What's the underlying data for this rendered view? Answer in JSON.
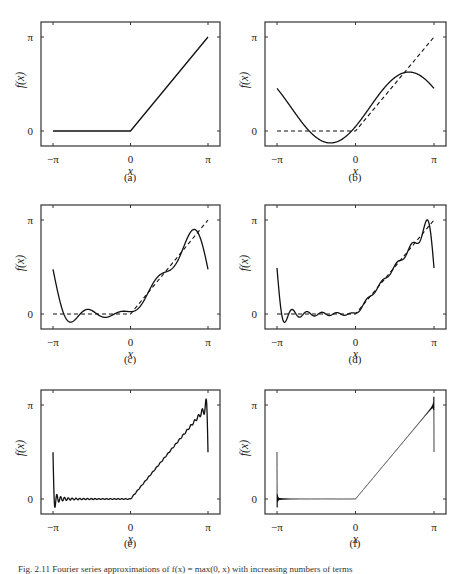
{
  "figure": {
    "caption": "Fig. 2.11  Fourier series approximations of f(x) = max(0, x) with increasing numbers of terms",
    "colors": {
      "curve": "#111111",
      "target": "#111111",
      "frame": "#333333",
      "text": "#222222"
    }
  },
  "axes_common": {
    "xlabel": "x",
    "ylabel": "f(x)",
    "xticks": [
      "−π",
      "0",
      "π"
    ],
    "yticks": [
      "0",
      "π"
    ]
  },
  "panels": [
    {
      "id": "a",
      "label": "(a)",
      "terms": 0,
      "show_target_dashed": false,
      "show_exact": true
    },
    {
      "id": "b",
      "label": "(b)",
      "terms": 1,
      "show_target_dashed": true,
      "show_exact": false
    },
    {
      "id": "c",
      "label": "(c)",
      "terms": 4,
      "show_target_dashed": true,
      "show_exact": false
    },
    {
      "id": "d",
      "label": "(d)",
      "terms": 10,
      "show_target_dashed": true,
      "show_exact": false
    },
    {
      "id": "e",
      "label": "(e)",
      "terms": 40,
      "show_target_dashed": false,
      "show_exact": false
    },
    {
      "id": "f",
      "label": "(f)",
      "terms": 400,
      "show_target_dashed": false,
      "show_exact": false
    }
  ],
  "chart_data": [
    {
      "type": "line",
      "title": "(a)",
      "xlabel": "x",
      "ylabel": "f(x)",
      "xlim": [
        -3.5,
        3.6
      ],
      "ylim": [
        -0.5,
        3.5
      ],
      "xticks": [
        "−π",
        "0",
        "π"
      ],
      "yticks": [
        "0",
        "π"
      ],
      "series": [
        {
          "name": "f(x) = max(0, x)",
          "style": "solid",
          "x": [
            -3.1416,
            0,
            3.1416
          ],
          "y": [
            0,
            0,
            3.1416
          ]
        }
      ]
    },
    {
      "type": "line",
      "title": "(b)",
      "xlabel": "x",
      "ylabel": "f(x)",
      "xlim": [
        -3.5,
        3.6
      ],
      "ylim": [
        -0.5,
        3.5
      ],
      "xticks": [
        "−π",
        "0",
        "π"
      ],
      "yticks": [
        "0",
        "π"
      ],
      "series": [
        {
          "name": "f(x)",
          "style": "dashed",
          "x": [
            -3.1416,
            0,
            3.1416
          ],
          "y": [
            0,
            0,
            3.1416
          ]
        },
        {
          "name": "Fourier approximation (1 term)",
          "style": "solid",
          "x": [
            -3.14,
            -2.0,
            -1.0,
            0,
            1.0,
            2.0,
            2.5,
            3.14
          ],
          "y": [
            1.42,
            0.35,
            -0.29,
            0.15,
            1.28,
            1.96,
            1.89,
            1.42
          ]
        }
      ]
    },
    {
      "type": "line",
      "title": "(c)",
      "xlabel": "x",
      "ylabel": "f(x)",
      "xlim": [
        -3.5,
        3.6
      ],
      "ylim": [
        -0.5,
        3.5
      ],
      "xticks": [
        "−π",
        "0",
        "π"
      ],
      "yticks": [
        "0",
        "π"
      ],
      "series": [
        {
          "name": "f(x)",
          "style": "dashed",
          "x": [
            -3.1416,
            0,
            3.1416
          ],
          "y": [
            0,
            0,
            3.1416
          ]
        },
        {
          "name": "Fourier approximation (few terms)",
          "style": "solid",
          "x": [
            -3.14,
            -2.7,
            -2.0,
            -1.0,
            0,
            1.0,
            2.0,
            2.7,
            3.14
          ],
          "y": [
            1.57,
            -0.2,
            0.15,
            0.1,
            0.0,
            1.0,
            2.0,
            2.9,
            1.57
          ]
        }
      ]
    },
    {
      "type": "line",
      "title": "(d)",
      "xlabel": "x",
      "ylabel": "f(x)",
      "xlim": [
        -3.5,
        3.6
      ],
      "ylim": [
        -0.5,
        3.5
      ],
      "xticks": [
        "−π",
        "0",
        "π"
      ],
      "yticks": [
        "0",
        "π"
      ],
      "series": [
        {
          "name": "f(x)",
          "style": "dashed",
          "x": [
            -3.1416,
            0,
            3.1416
          ],
          "y": [
            0,
            0,
            3.1416
          ]
        },
        {
          "name": "Fourier approximation (more terms)",
          "style": "solid",
          "x": [
            -3.14,
            -2.95,
            -2.0,
            0,
            1.0,
            2.0,
            2.9,
            3.14
          ],
          "y": [
            1.57,
            -0.25,
            0.05,
            0.0,
            1.0,
            2.0,
            3.1,
            1.57
          ]
        }
      ]
    },
    {
      "type": "line",
      "title": "(e)",
      "xlabel": "x",
      "ylabel": "f(x)",
      "xlim": [
        -3.5,
        3.6
      ],
      "ylim": [
        -0.5,
        3.5
      ],
      "xticks": [
        "−π",
        "0",
        "π"
      ],
      "yticks": [
        "0",
        "π"
      ],
      "series": [
        {
          "name": "Fourier approximation (many terms)",
          "style": "solid",
          "x": [
            -3.14,
            -3.08,
            -2.0,
            0,
            3.0,
            3.09,
            3.14
          ],
          "y": [
            1.57,
            -0.3,
            0.0,
            0.0,
            3.0,
            3.4,
            1.57
          ]
        }
      ]
    },
    {
      "type": "line",
      "title": "(f)",
      "xlabel": "x",
      "ylabel": "f(x)",
      "xlim": [
        -3.5,
        3.6
      ],
      "ylim": [
        -0.5,
        3.5
      ],
      "xticks": [
        "−π",
        "0",
        "π"
      ],
      "yticks": [
        "0",
        "π"
      ],
      "series": [
        {
          "name": "Fourier approximation (very many terms)",
          "style": "solid",
          "x": [
            -3.14,
            -3.13,
            -2.0,
            0,
            3.12,
            3.135,
            3.14
          ],
          "y": [
            1.57,
            -0.28,
            0.0,
            0.0,
            3.1,
            3.45,
            1.57
          ]
        }
      ]
    }
  ]
}
